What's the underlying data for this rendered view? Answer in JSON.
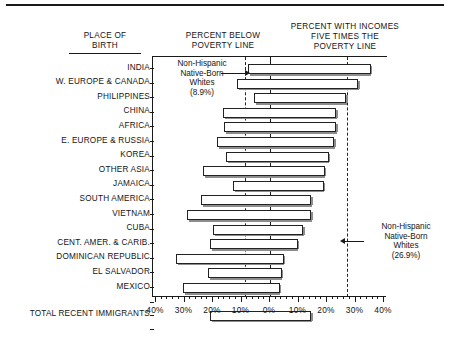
{
  "headers": {
    "place_of_birth": "PLACE OF\nBIRTH",
    "percent_below": "PERCENT BELOW\nPOVERTY LINE",
    "percent_five_times": "PERCENT WITH INCOMES\nFIVE TIMES THE\nPOVERTY LINE"
  },
  "annotations": {
    "left": "Non-Hispanic\nNative-Born\nWhites\n(8.9%)",
    "right": "Non-Hispanic\nNative-Born\nWhites\n(26.9%)"
  },
  "axis": {
    "tick_labels": [
      "40%",
      "30%",
      "20%",
      "10%",
      "0%",
      "10%",
      "20%",
      "30%",
      "40%"
    ],
    "tick_values": [
      -40,
      -30,
      -20,
      -10,
      0,
      10,
      20,
      30,
      40
    ],
    "min": -40,
    "max": 40
  },
  "colors": {
    "ink": "#1a1a1a",
    "bar_fill": "#ffffff",
    "bar_stroke": "#222222",
    "bar_shadow": "#8d8d8d",
    "background": "#ffffff"
  },
  "chart_data": {
    "type": "bar",
    "title": "",
    "subtitle": "",
    "xlabel": "",
    "ylabel": "PLACE OF BIRTH",
    "orientation": "horizontal",
    "layout": "diverging-bidirectional",
    "xlim": [
      -40,
      40
    ],
    "grid": false,
    "legend": "none",
    "note": "Each bar is a single horizontal span: its left end marks PERCENT BELOW POVERTY LINE (read on the left 0-40% scale) and its right end marks PERCENT WITH INCOMES FIVE TIMES THE POVERTY LINE (read on the right 0-40% scale).",
    "reference_lines": [
      {
        "label": "Non-Hispanic Native-Born Whites below poverty line",
        "value": -8.9,
        "style": "dashed"
      },
      {
        "label": "Non-Hispanic Native-Born Whites five times poverty line",
        "value": 26.9,
        "style": "dashed"
      }
    ],
    "categories": [
      "INDIA",
      "W. EUROPE & CANADA",
      "PHILIPPINES",
      "CHINA",
      "AFRICA",
      "E. EUROPE & RUSSIA",
      "KOREA",
      "OTHER ASIA",
      "JAMAICA",
      "SOUTH AMERICA",
      "VIETNAM",
      "CUBA",
      "CENT. AMER. & CARIB.",
      "DOMINICAN REPUBLIC",
      "EL SALVADOR",
      "MEXICO",
      "TOTAL RECENT IMMIGRANTS"
    ],
    "series": [
      {
        "name": "PERCENT BELOW POVERTY LINE",
        "values": [
          7.7,
          11.6,
          5.6,
          16.5,
          16.1,
          18.6,
          15.4,
          23.5,
          13.0,
          24.2,
          29.1,
          20.0,
          21.1,
          33.0,
          21.8,
          30.5,
          21.1
        ]
      },
      {
        "name": "PERCENT WITH INCOMES FIVE TIMES THE POVERTY LINE",
        "values": [
          35.4,
          30.9,
          26.7,
          23.2,
          23.2,
          22.5,
          20.7,
          19.3,
          18.9,
          14.4,
          14.4,
          11.6,
          9.8,
          4.9,
          4.2,
          3.5,
          14.4
        ]
      }
    ]
  }
}
